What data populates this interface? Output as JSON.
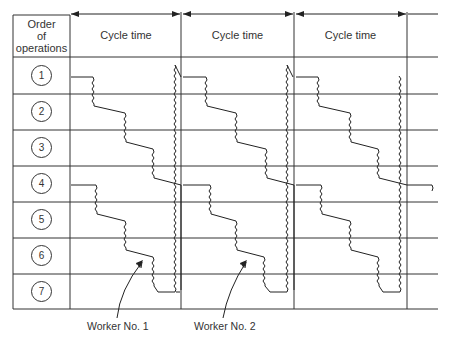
{
  "header": {
    "order_label_line1": "Order",
    "order_label_line2": "of",
    "order_label_line3": "operations",
    "cycle_labels": [
      "Cycle time",
      "Cycle time",
      "Cycle time"
    ]
  },
  "operations": [
    "1",
    "2",
    "3",
    "4",
    "5",
    "6",
    "7"
  ],
  "workers": [
    {
      "label": "Worker No. 1"
    },
    {
      "label": "Worker No. 2"
    }
  ],
  "colors": {
    "line": "#2a2a2a",
    "background": "#ffffff"
  }
}
